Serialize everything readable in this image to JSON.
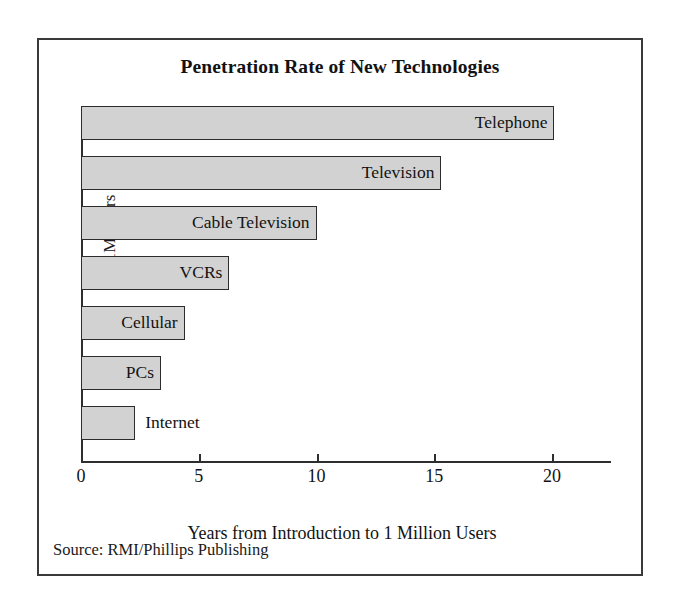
{
  "figure": {
    "title": "Penetration Rate of New Technologies",
    "source_note": "Source: RMI/Phillips Publishing"
  },
  "chart_data": {
    "type": "bar",
    "orientation": "horizontal",
    "title": "Penetration Rate of New Technologies",
    "xlabel": "Years from Introduction to 1 Million Users",
    "ylabel": "1M Users",
    "xlim": [
      0,
      22.5
    ],
    "xticks": [
      0,
      5,
      10,
      15,
      20
    ],
    "xtick_labels": [
      "0",
      "5",
      "10",
      "15",
      "20"
    ],
    "grid": false,
    "legend": false,
    "bar_color": "#d2d2d2",
    "bar_edge_color": "#2c2c2c",
    "categories": [
      "Telephone",
      "Television",
      "Cable Television",
      "VCRs",
      "Cellular",
      "PCs",
      "Internet"
    ],
    "values": [
      20.1,
      15.3,
      10.0,
      6.3,
      4.4,
      3.4,
      2.3
    ],
    "bars": [
      {
        "label": "Telephone",
        "value": 20.1,
        "label_position": "inside"
      },
      {
        "label": "Television",
        "value": 15.3,
        "label_position": "inside"
      },
      {
        "label": "Cable Television",
        "value": 10.0,
        "label_position": "inside"
      },
      {
        "label": "VCRs",
        "value": 6.3,
        "label_position": "inside"
      },
      {
        "label": "Cellular",
        "value": 4.4,
        "label_position": "inside"
      },
      {
        "label": "PCs",
        "value": 3.4,
        "label_position": "inside"
      },
      {
        "label": "Internet",
        "value": 2.3,
        "label_position": "outside"
      }
    ]
  }
}
